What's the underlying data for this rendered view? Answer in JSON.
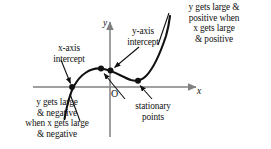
{
  "figure": {
    "type": "diagram",
    "background_color": "#ffffff",
    "ink_color": "#111111",
    "axis_color": "#808080",
    "axes": {
      "y_axis_label": "y",
      "x_axis_label": "x",
      "origin_label": "O",
      "y_axis_x_px": 110,
      "x_axis_y_px": 87
    },
    "annotations": {
      "top_right": "y gets large &\npositive when\nx gets large\n& positive",
      "x_axis_intercept": "x-axis\nintercept",
      "y_axis_intercept": "y-axis\nintercept",
      "stationary_points": "stationary\npoints",
      "bottom_left": "y gets large\n& negative\nwhen x gets large\n& negative"
    },
    "marked_points": [
      {
        "name": "x-axis-intercept-dot",
        "x": 72,
        "y": 87
      },
      {
        "name": "stationary-point-maximum-dot",
        "x": 101,
        "y": 69
      },
      {
        "name": "y-axis-intercept-dot",
        "x": 111,
        "y": 71
      },
      {
        "name": "stationary-point-minimum-dot",
        "x": 138,
        "y": 80
      }
    ],
    "leader_lines": [
      {
        "name": "leader-x-axis-intercept",
        "from_x": 62,
        "from_y": 58,
        "to_x": 70,
        "to_y": 84
      },
      {
        "name": "leader-y-axis-intercept",
        "from_x": 140,
        "from_y": 48,
        "to_x": 114,
        "to_y": 68
      },
      {
        "name": "leader-stationary-max",
        "from_x": 126,
        "from_y": 99,
        "to_x": 104,
        "to_y": 73
      },
      {
        "name": "leader-stationary-min",
        "from_x": 152,
        "from_y": 99,
        "to_x": 140,
        "to_y": 84
      },
      {
        "name": "leader-top-right",
        "from_x": 170,
        "from_y": 14,
        "to_x": 158,
        "to_y": 44
      },
      {
        "name": "leader-bottom-left",
        "from_x": 79,
        "from_y": 120,
        "to_x": 70,
        "to_y": 93
      }
    ]
  }
}
